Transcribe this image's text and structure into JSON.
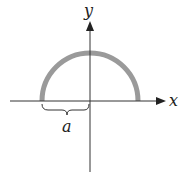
{
  "diagram": {
    "axes": {
      "x_label": "x",
      "y_label": "y"
    },
    "semicircle": {
      "color": "#9a9a9a",
      "description": "upper semicircle centered at origin"
    },
    "brace": {
      "label": "a",
      "description": "radius from left end of semicircle to origin"
    },
    "colors": {
      "axis": "#333333",
      "text": "#222222"
    }
  }
}
